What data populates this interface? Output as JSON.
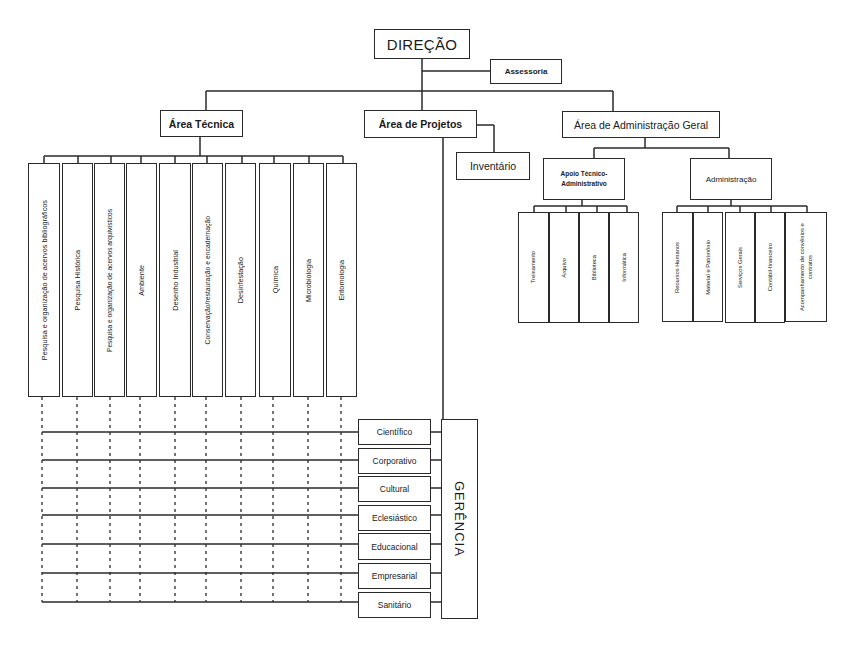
{
  "chart": {
    "root": {
      "label": "DIREÇÃO"
    },
    "advisory": {
      "label": "Assessoria"
    },
    "areas": [
      {
        "label": "Área Técnica"
      },
      {
        "label": "Área de Projetos"
      },
      {
        "label": "Área de Administração Geral"
      }
    ],
    "tecnica_units": [
      "Pesquisa e organização de acervos bibliográficos",
      "Pesquisa Histórica",
      "Pesquisa e organização de acervos arquivísticos",
      "Ambiente",
      "Desenho Industrial",
      "Conservação/restauração e encadernação",
      "Desinfestação",
      "Química",
      "Microbiologia",
      "Entomologia"
    ],
    "projetos": {
      "inventario": "Inventário",
      "gerencia": "GERÊNCIA",
      "sectors": [
        "Científico",
        "Corporativo",
        "Cultural",
        "Eclesiástico",
        "Educacional",
        "Empresarial",
        "Sanitário"
      ]
    },
    "admin_geral": {
      "apoio": {
        "label": "Apoio Técnico-Administrativo",
        "units": [
          "Treinamento",
          "Arquivo",
          "Biblioteca",
          "Informática"
        ]
      },
      "administracao": {
        "label": "Administração",
        "units": [
          "Recursos Humanos",
          "Material e Patrimônio",
          "Serviços Gerais",
          "Contábil-financeiro",
          "Acompanhamento de convênios e contratos"
        ]
      }
    }
  },
  "colors": {
    "line": "#2a2a2a",
    "background": "#ffffff"
  }
}
